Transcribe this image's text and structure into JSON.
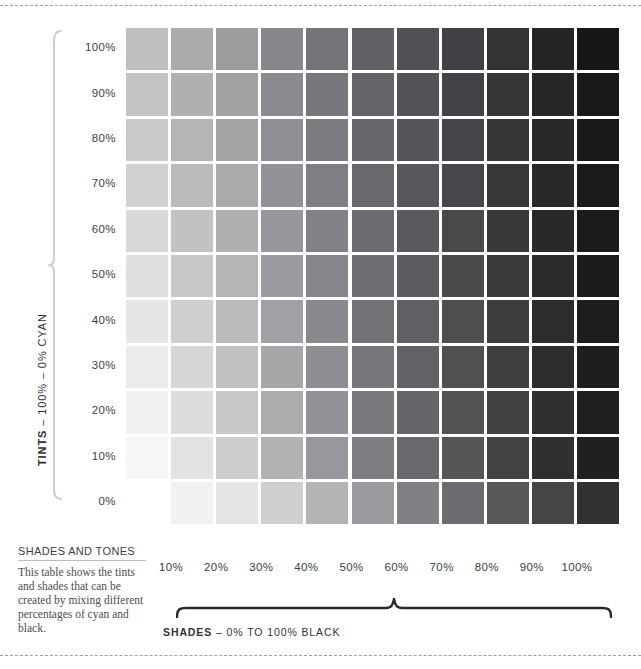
{
  "rules": {
    "top": "dashed-rule",
    "bottom": "dashed-rule"
  },
  "tints_axis": {
    "label_strong": "TINTS",
    "label_rest": " – 100% – 0% CYAN",
    "bracket_color": "#c9ccce"
  },
  "shades_axis": {
    "caption_strong": "SHADES",
    "caption_rest": " – 0%  TO 100% BLACK",
    "bracket_color": "#2b2b2b"
  },
  "note": {
    "title": "SHADES AND TONES",
    "body": "This table shows the tints and shades that can be created by mixing different percentages of cyan and black."
  },
  "chart_data": {
    "type": "heatmap",
    "title": "SHADES AND TONES",
    "xlabel": "SHADES – 0% TO 100% BLACK",
    "ylabel": "TINTS – 100% – 0% CYAN",
    "grid": false,
    "legend": "none",
    "x_tick_labels": [
      "10%",
      "20%",
      "30%",
      "40%",
      "50%",
      "60%",
      "70%",
      "80%",
      "90%",
      "100%"
    ],
    "y_tick_labels": [
      "100%",
      "90%",
      "80%",
      "70%",
      "60%",
      "50%",
      "40%",
      "30%",
      "20%",
      "10%",
      "0%"
    ],
    "columns": [
      0,
      10,
      20,
      30,
      40,
      50,
      60,
      70,
      80,
      90,
      100
    ],
    "rows": [
      100,
      90,
      80,
      70,
      60,
      50,
      40,
      30,
      20,
      10,
      0
    ],
    "note": "Top ten rows (100%-10% tint) span 11 columns (0%-100% black). The bottom 0% tint row is offset one column and spans 10 swatches (10%-100% black).",
    "swatch_colors": [
      [
        "#bdbfc1",
        "#a9abad",
        "#9b9d9f",
        "#85878a",
        "#73757a",
        "#5f6165",
        "#4f5154",
        "#3f4144",
        "#313335",
        "#232527",
        "#161718"
      ],
      [
        "#c2c4c6",
        "#aeb0b2",
        "#9fa1a3",
        "#898b8e",
        "#76787c",
        "#626468",
        "#515356",
        "#414346",
        "#333537",
        "#252628",
        "#171819"
      ],
      [
        "#c8cacc",
        "#b3b5b7",
        "#a3a5a7",
        "#8d8f92",
        "#7a7c80",
        "#65676b",
        "#545659",
        "#434548",
        "#353739",
        "#262829",
        "#18191a"
      ],
      [
        "#cfd1d3",
        "#b9bbbd",
        "#a8aaac",
        "#919396",
        "#7d7f83",
        "#68696d",
        "#56585b",
        "#45474a",
        "#36383a",
        "#27292a",
        "#191a1b"
      ],
      [
        "#d6d8da",
        "#c0c2c4",
        "#adafb1",
        "#95979a",
        "#808286",
        "#6b6c70",
        "#585a5d",
        "#47494b",
        "#38393b",
        "#28292b",
        "#1a1b1c"
      ],
      [
        "#dddfe1",
        "#c6c8ca",
        "#b3b5b7",
        "#9a9c9f",
        "#84868a",
        "#6e6f73",
        "#5b5d60",
        "#494b4d",
        "#393b3d",
        "#2a2b2c",
        "#1b1c1d"
      ],
      [
        "#e4e6e7",
        "#cdcfd1",
        "#b9bbbd",
        "#9fa1a4",
        "#888a8e",
        "#717276",
        "#5e6063",
        "#4c4e50",
        "#3b3d3f",
        "#2b2c2d",
        "#1c1d1e"
      ],
      [
        "#eaecec",
        "#d4d6d8",
        "#bfc1c3",
        "#a5a7a9",
        "#8c8e92",
        "#757679",
        "#616366",
        "#4e5052",
        "#3d3f41",
        "#2c2d2f",
        "#1d1e1f"
      ],
      [
        "#f0f1f2",
        "#dbdddf",
        "#c5c7c9",
        "#aaacae",
        "#919397",
        "#787a7d",
        "#646669",
        "#515355",
        "#3f4143",
        "#2e2f30",
        "#1e1f20"
      ],
      [
        "#f5f6f6",
        "#e1e3e4",
        "#cbcdcf",
        "#b0b2b4",
        "#96989b",
        "#7c7e81",
        "#67696c",
        "#545658",
        "#414345",
        "#2f3031",
        "#1f2021"
      ],
      [
        "#f0f1f2",
        "#e3e5e6",
        "#cdcfd1",
        "#b2b4b6",
        "#999b9e",
        "#7f8184",
        "#6a6c6f",
        "#56585a",
        "#434547",
        "#313233",
        null
      ]
    ]
  }
}
